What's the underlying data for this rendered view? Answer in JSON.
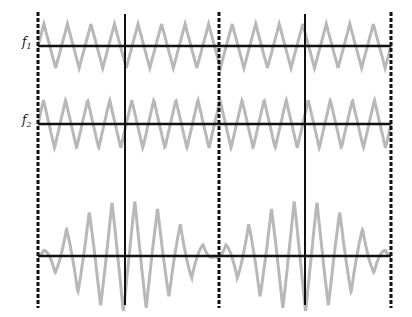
{
  "diagram": {
    "labels": [
      {
        "id": "f1",
        "base": "f",
        "sub": "1",
        "x": 22,
        "y": 38
      },
      {
        "id": "f2",
        "base": "f",
        "sub": "2",
        "x": 22,
        "y": 116
      }
    ],
    "colors": {
      "wave": "#b8b8b8",
      "axis": "#111111",
      "background": "#ffffff"
    },
    "dashed_lines_x": [
      38,
      219,
      391
    ],
    "solid_lines_x": [
      125,
      305
    ],
    "vertical_span": {
      "top": 12,
      "bottom": 308
    },
    "solid_span": {
      "top": 14,
      "bottom": 305
    },
    "rows": [
      {
        "id": "f1-wave",
        "baseline_y": 46,
        "amplitude": 22,
        "cycles": 15,
        "x_start": 38,
        "x_end": 391,
        "type": "sine"
      },
      {
        "id": "f2-wave",
        "baseline_y": 124,
        "amplitude": 24,
        "cycles": 16,
        "x_start": 38,
        "x_end": 391,
        "type": "sine"
      },
      {
        "id": "beat-wave",
        "baseline_y": 256,
        "amplitude": 56,
        "cycles": 15.5,
        "beat_periods": 2,
        "x_start": 38,
        "x_end": 391,
        "type": "beat"
      }
    ]
  }
}
